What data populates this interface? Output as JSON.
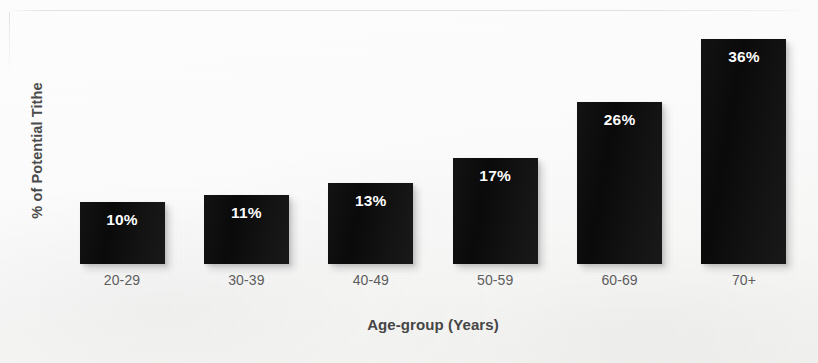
{
  "chart_data": {
    "type": "bar",
    "title": "",
    "subtitle": "",
    "xlabel": "Age-group (Years)",
    "ylabel": "% of Potential Tithe",
    "categories": [
      "20-29",
      "30-39",
      "40-49",
      "50-59",
      "60-69",
      "70+"
    ],
    "values": [
      10,
      11,
      13,
      17,
      26,
      36
    ],
    "data_labels": [
      "10%",
      "11%",
      "13%",
      "17%",
      "26%",
      "36%"
    ],
    "unit": "%",
    "series": [
      {
        "name": "% of Potential Tithe",
        "values": [
          10,
          11,
          13,
          17,
          26,
          36
        ]
      }
    ],
    "ylim": [
      0,
      40
    ],
    "xlim_categories": 6,
    "grid": false,
    "y_axis_ticks_visible": false,
    "x_axis_line_visible": false,
    "legend": false,
    "legend_position": "none",
    "orientation": "vertical",
    "bar_color": "#0d0d0d",
    "data_label_color": "#fdfdfd",
    "data_label_position": "inside-top",
    "axis_title_color": "#454545",
    "tick_label_color": "#5d5d5d",
    "background_color": "#fbfbfa",
    "annotations": []
  },
  "axes": {
    "y_title": "% of Potential Tithe",
    "x_title": "Age-group (Years)"
  },
  "bars": [
    {
      "category": "20-29",
      "label": "10%",
      "value": 10
    },
    {
      "category": "30-39",
      "label": "11%",
      "value": 11
    },
    {
      "category": "40-49",
      "label": "13%",
      "value": 13
    },
    {
      "category": "50-59",
      "label": "17%",
      "value": 17
    },
    {
      "category": "60-69",
      "label": "26%",
      "value": 26
    },
    {
      "category": "70+",
      "label": "36%",
      "value": 36
    }
  ]
}
